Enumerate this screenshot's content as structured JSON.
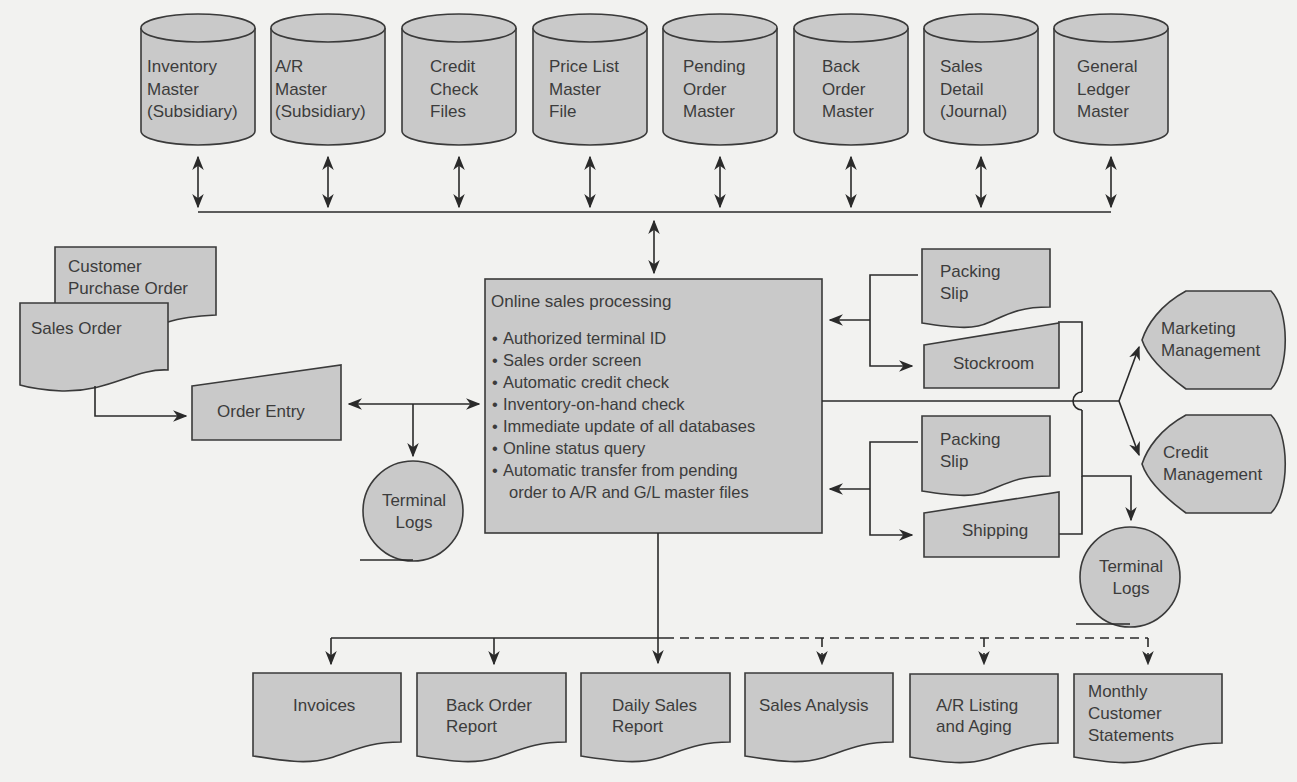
{
  "colors": {
    "background": "#f2f2f0",
    "shape_fill": "#c9c9c9",
    "stroke": "#2a2a2a",
    "text": "#3c3c3c"
  },
  "databases": [
    {
      "id": "inventory-master",
      "lines": [
        "Inventory",
        "Master",
        "(Subsidiary)"
      ]
    },
    {
      "id": "ar-master",
      "lines": [
        "A/R",
        "Master",
        "(Subsidiary)"
      ]
    },
    {
      "id": "credit-check-files",
      "lines": [
        "Credit",
        "Check",
        "Files"
      ]
    },
    {
      "id": "price-list-master",
      "lines": [
        "Price List",
        "Master",
        "File"
      ]
    },
    {
      "id": "pending-order-master",
      "lines": [
        "Pending",
        "Order",
        "Master"
      ]
    },
    {
      "id": "back-order-master",
      "lines": [
        "Back",
        "Order",
        "Master"
      ]
    },
    {
      "id": "sales-detail-journal",
      "lines": [
        "Sales",
        "Detail",
        "(Journal)"
      ]
    },
    {
      "id": "general-ledger-master",
      "lines": [
        "General",
        "Ledger",
        "Master"
      ]
    }
  ],
  "input_documents": {
    "customer_po": [
      "Customer",
      "Purchase Order"
    ],
    "sales_order": "Sales Order"
  },
  "order_entry": "Order Entry",
  "terminal_logs_left": [
    "Terminal",
    "Logs"
  ],
  "process": {
    "title": "Online sales processing",
    "bullets": [
      "Authorized terminal ID",
      "Sales order screen",
      "Automatic credit check",
      "Inventory-on-hand check",
      "Immediate update of all databases",
      "Online status query",
      "Automatic transfer from pending",
      "order to A/R and G/L master files"
    ]
  },
  "right_outputs": {
    "packing_slip_1": [
      "Packing",
      "Slip"
    ],
    "stockroom": "Stockroom",
    "packing_slip_2": [
      "Packing",
      "Slip"
    ],
    "shipping": "Shipping"
  },
  "displays": {
    "marketing": [
      "Marketing",
      "Management"
    ],
    "credit": [
      "Credit",
      "Management"
    ]
  },
  "terminal_logs_right": [
    "Terminal",
    "Logs"
  ],
  "reports": [
    {
      "id": "invoices",
      "lines": [
        "Invoices"
      ]
    },
    {
      "id": "back-order-report",
      "lines": [
        "Back Order",
        "Report"
      ]
    },
    {
      "id": "daily-sales-report",
      "lines": [
        "Daily Sales",
        "Report"
      ]
    },
    {
      "id": "sales-analysis",
      "lines": [
        "Sales Analysis"
      ]
    },
    {
      "id": "ar-listing-aging",
      "lines": [
        "A/R Listing",
        "and Aging"
      ]
    },
    {
      "id": "monthly-customer-statements",
      "lines": [
        "Monthly",
        "Customer",
        "Statements"
      ]
    }
  ]
}
